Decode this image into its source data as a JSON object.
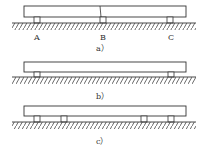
{
  "diagrams": [
    {
      "id": "a",
      "caption": "a）",
      "beam": {
        "x": 24,
        "y": 6,
        "w": 162,
        "h": 11,
        "break_x": 100
      },
      "supports": [
        {
          "x": 36,
          "label": "A"
        },
        {
          "x": 102,
          "label": "B"
        },
        {
          "x": 170,
          "label": "C"
        }
      ],
      "ground_y": 23
    },
    {
      "id": "b",
      "caption": "b）",
      "beam": {
        "x": 24,
        "y": 62,
        "w": 162,
        "h": 10
      },
      "supports": [
        {
          "x": 36
        },
        {
          "x": 170
        }
      ],
      "ground_y": 77
    },
    {
      "id": "c",
      "caption": "c）",
      "beam": {
        "x": 24,
        "y": 106,
        "w": 162,
        "h": 10
      },
      "supports": [
        {
          "x": 36
        },
        {
          "x": 63
        },
        {
          "x": 144
        },
        {
          "x": 170
        }
      ],
      "ground_y": 122
    }
  ],
  "labels": {
    "A": "A",
    "B": "B",
    "C": "C",
    "cap_a": "a）",
    "cap_b": "b）",
    "cap_c": "c）"
  }
}
